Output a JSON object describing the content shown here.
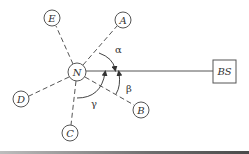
{
  "diagram": {
    "center_node": {
      "label": "N",
      "x": 77,
      "y": 72,
      "r": 9
    },
    "base_station": {
      "label": "BS",
      "x": 213,
      "y": 60,
      "w": 23,
      "h": 23
    },
    "link_line": {
      "from": "N",
      "to": "BS",
      "style": "solid"
    },
    "peripheral_nodes": [
      {
        "id": "A",
        "label": "A",
        "x": 123,
        "y": 20,
        "r": 8
      },
      {
        "id": "E",
        "label": "E",
        "x": 52,
        "y": 18,
        "r": 8
      },
      {
        "id": "D",
        "label": "D",
        "x": 21,
        "y": 99,
        "r": 8
      },
      {
        "id": "C",
        "label": "C",
        "x": 70,
        "y": 133,
        "r": 8
      },
      {
        "id": "B",
        "label": "B",
        "x": 141,
        "y": 110,
        "r": 8
      }
    ],
    "angles": [
      {
        "name": "alpha",
        "symbol": "α",
        "between": [
          "A",
          "BS"
        ]
      },
      {
        "name": "beta",
        "symbol": "β",
        "between": [
          "B",
          "BS"
        ]
      },
      {
        "name": "gamma",
        "symbol": "γ",
        "between": [
          "C",
          "BS"
        ]
      }
    ],
    "colors": {
      "stroke": "#555555",
      "text": "#333333",
      "background": "#ffffff"
    }
  }
}
